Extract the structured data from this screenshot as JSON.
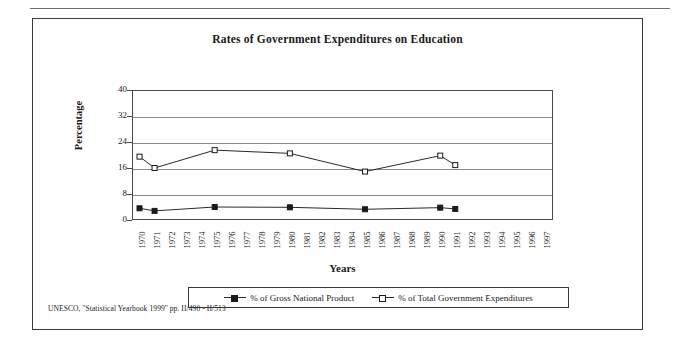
{
  "chart_data": {
    "type": "line",
    "title": "Rates of Government Expenditures on Education",
    "xlabel": "Years",
    "ylabel": "Percentage",
    "ylim": [
      0,
      40
    ],
    "yticks": [
      0,
      8,
      16,
      24,
      32,
      40
    ],
    "grid": true,
    "legend_position": "bottom",
    "categories": [
      "1970",
      "1971",
      "1972",
      "1973",
      "1974",
      "1975",
      "1976",
      "1977",
      "1978",
      "1979",
      "1980",
      "1981",
      "1982",
      "1983",
      "1984",
      "1985",
      "1986",
      "1987",
      "1988",
      "1989",
      "1990",
      "1991",
      "1992",
      "1993",
      "1994",
      "1995",
      "1996",
      "1997"
    ],
    "x": [
      1970,
      1971,
      1975,
      1980,
      1985,
      1990,
      1991
    ],
    "series": [
      {
        "name": "% of Gross National Product",
        "marker": "filled-square",
        "x": [
          1970,
          1971,
          1975,
          1980,
          1985,
          1990,
          1991
        ],
        "values": [
          3.6,
          2.8,
          4.0,
          3.9,
          3.3,
          3.8,
          3.4
        ]
      },
      {
        "name": "% of Total Government Expenditures",
        "marker": "open-square",
        "x": [
          1970,
          1971,
          1975,
          1980,
          1985,
          1990,
          1991
        ],
        "values": [
          19.5,
          16.0,
          21.5,
          20.5,
          14.9,
          19.8,
          16.9
        ]
      }
    ]
  },
  "source_note": "UNESCO, ''Statistical Yearbook 1999'' pp. II/490 - II/513"
}
